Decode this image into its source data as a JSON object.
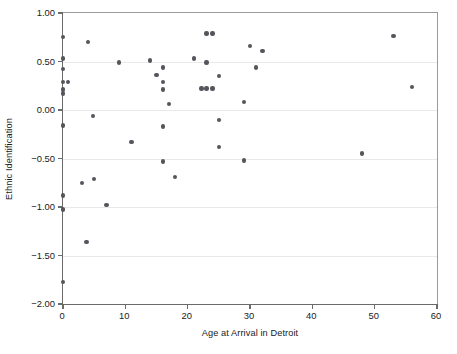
{
  "chart_data": {
    "type": "scatter",
    "title": "",
    "xlabel": "Age at Arrival in Detroit",
    "ylabel": "Ethnic Identification",
    "xlim": [
      0,
      60
    ],
    "ylim": [
      -2.0,
      1.0
    ],
    "xticks": [
      0,
      10,
      20,
      30,
      40,
      50,
      60
    ],
    "xtick_labels": [
      "0",
      "10",
      "20",
      "30",
      "40",
      "50",
      "60"
    ],
    "yticks": [
      -2.0,
      -1.5,
      -1.0,
      -0.5,
      0.0,
      0.5,
      1.0
    ],
    "ytick_labels": [
      "-2.00",
      "-1.50",
      "-1.00",
      "-0.50",
      "0.00",
      "0.50",
      "1.00"
    ],
    "grid": "horizontal",
    "legend": null,
    "marker": {
      "shape": "circle",
      "color": "#54565b",
      "size": 4.4
    },
    "axis_color": "#6b6b6b",
    "grid_color": "#e9e9e9",
    "background": "#ffffff",
    "n_points": 48,
    "points": [
      {
        "x": 0.0,
        "y": 0.75
      },
      {
        "x": 0.0,
        "y": 0.53
      },
      {
        "x": 0.0,
        "y": 0.42
      },
      {
        "x": 0.0,
        "y": 0.29
      },
      {
        "x": 0.8,
        "y": 0.29
      },
      {
        "x": 0.0,
        "y": 0.21
      },
      {
        "x": 0.0,
        "y": 0.17
      },
      {
        "x": 0.0,
        "y": -0.16
      },
      {
        "x": 0.0,
        "y": -0.88
      },
      {
        "x": 0.0,
        "y": -1.02
      },
      {
        "x": 0.0,
        "y": -1.03
      },
      {
        "x": 0.0,
        "y": -1.77
      },
      {
        "x": 3.0,
        "y": -0.75
      },
      {
        "x": 3.8,
        "y": -1.36
      },
      {
        "x": 4.0,
        "y": 0.7
      },
      {
        "x": 4.8,
        "y": -0.06
      },
      {
        "x": 5.0,
        "y": -0.71
      },
      {
        "x": 7.0,
        "y": -0.98
      },
      {
        "x": 9.0,
        "y": 0.49
      },
      {
        "x": 11.0,
        "y": -0.33
      },
      {
        "x": 14.0,
        "y": 0.51
      },
      {
        "x": 15.0,
        "y": 0.36
      },
      {
        "x": 16.0,
        "y": 0.44
      },
      {
        "x": 16.0,
        "y": 0.29
      },
      {
        "x": 16.0,
        "y": 0.21
      },
      {
        "x": 16.0,
        "y": -0.17
      },
      {
        "x": 16.0,
        "y": -0.53
      },
      {
        "x": 17.0,
        "y": 0.06
      },
      {
        "x": 18.0,
        "y": -0.69
      },
      {
        "x": 21.0,
        "y": 0.53
      },
      {
        "x": 22.2,
        "y": 0.22
      },
      {
        "x": 23.0,
        "y": 0.79
      },
      {
        "x": 23.0,
        "y": 0.22
      },
      {
        "x": 23.0,
        "y": 0.49
      },
      {
        "x": 24.0,
        "y": 0.79
      },
      {
        "x": 24.0,
        "y": 0.22
      },
      {
        "x": 25.0,
        "y": 0.35
      },
      {
        "x": 25.0,
        "y": -0.1
      },
      {
        "x": 25.0,
        "y": -0.38
      },
      {
        "x": 29.0,
        "y": 0.08
      },
      {
        "x": 29.0,
        "y": -0.52
      },
      {
        "x": 30.0,
        "y": 0.66
      },
      {
        "x": 31.0,
        "y": 0.44
      },
      {
        "x": 32.0,
        "y": 0.61
      },
      {
        "x": 48.0,
        "y": -0.45
      },
      {
        "x": 53.0,
        "y": 0.76
      },
      {
        "x": 56.0,
        "y": 0.24
      }
    ]
  }
}
